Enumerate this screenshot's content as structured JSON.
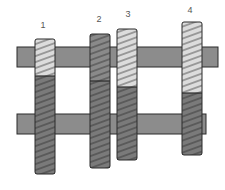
{
  "diagram": {
    "type": "gear-shaft-assembly",
    "colors": {
      "shaft": "#8c8c8c",
      "gear_light": "#dcdcdc",
      "gear_dark": "#7a7a7a",
      "gear_mid": "#8a8a8a",
      "outline": "#2a2a2a"
    },
    "shafts": [
      {
        "name": "upper-shaft"
      },
      {
        "name": "lower-shaft"
      }
    ],
    "gears": [
      {
        "label": "1",
        "upper_shade": "light"
      },
      {
        "label": "2",
        "upper_shade": "mid"
      },
      {
        "label": "3",
        "upper_shade": "light"
      },
      {
        "label": "4",
        "upper_shade": "light"
      }
    ]
  }
}
